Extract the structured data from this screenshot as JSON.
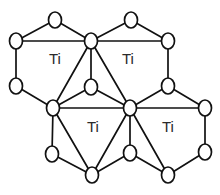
{
  "figure": {
    "background_color": "#ffffff",
    "line_color": "#111111",
    "node_fill_color": "#ffffff",
    "label_color": "#2b2b2b",
    "width": 220,
    "height": 195
  },
  "labels": [
    {
      "text": "Ti",
      "x": 55,
      "y": 60
    },
    {
      "text": "Ti",
      "x": 128,
      "y": 60
    },
    {
      "text": "Ti",
      "x": 93,
      "y": 128
    },
    {
      "text": "Ti",
      "x": 168,
      "y": 128
    }
  ],
  "nodes": [
    {
      "id": "n1",
      "name": "atom-top-left-apex",
      "x": 55,
      "y": 20,
      "rx": 6.5,
      "ry": 8
    },
    {
      "id": "n2",
      "name": "atom-top-right-apex",
      "x": 131,
      "y": 20,
      "rx": 6.5,
      "ry": 8
    },
    {
      "id": "n3",
      "name": "atom-upper-left-corner",
      "x": 16,
      "y": 41,
      "rx": 6.5,
      "ry": 8
    },
    {
      "id": "n4",
      "name": "atom-upper-center-hub",
      "x": 91,
      "y": 41,
      "rx": 6.5,
      "ry": 8
    },
    {
      "id": "n5",
      "name": "atom-upper-right-corner",
      "x": 168,
      "y": 41,
      "rx": 6.5,
      "ry": 8
    },
    {
      "id": "n6",
      "name": "atom-mid-left-edge",
      "x": 16,
      "y": 86,
      "rx": 6.5,
      "ry": 8
    },
    {
      "id": "n7",
      "name": "atom-mid-center-bridge",
      "x": 91,
      "y": 87,
      "rx": 6.5,
      "ry": 8
    },
    {
      "id": "n8",
      "name": "atom-mid-right-edge",
      "x": 168,
      "y": 86,
      "rx": 6.5,
      "ry": 8
    },
    {
      "id": "n9",
      "name": "atom-center-left-hub",
      "x": 53,
      "y": 108,
      "rx": 6.5,
      "ry": 8
    },
    {
      "id": "n10",
      "name": "atom-center-right-hub",
      "x": 130,
      "y": 108,
      "rx": 6.5,
      "ry": 8
    },
    {
      "id": "n11",
      "name": "atom-right-corner-upper",
      "x": 205,
      "y": 108,
      "rx": 6.5,
      "ry": 8
    },
    {
      "id": "n12",
      "name": "atom-lower-left-edge",
      "x": 52,
      "y": 154,
      "rx": 6.5,
      "ry": 8
    },
    {
      "id": "n13",
      "name": "atom-lower-center-edge",
      "x": 130,
      "y": 153,
      "rx": 6.5,
      "ry": 8
    },
    {
      "id": "n14",
      "name": "atom-lower-right-edge",
      "x": 205,
      "y": 152,
      "rx": 6.5,
      "ry": 8
    },
    {
      "id": "n15",
      "name": "atom-bottom-left-apex",
      "x": 92,
      "y": 175,
      "rx": 6.5,
      "ry": 8
    },
    {
      "id": "n16",
      "name": "atom-bottom-right-apex",
      "x": 168,
      "y": 175,
      "rx": 6.5,
      "ry": 8
    }
  ],
  "edges": [
    {
      "from": "n1",
      "to": "n3"
    },
    {
      "from": "n1",
      "to": "n4"
    },
    {
      "from": "n2",
      "to": "n4"
    },
    {
      "from": "n2",
      "to": "n5"
    },
    {
      "from": "n3",
      "to": "n4"
    },
    {
      "from": "n4",
      "to": "n5"
    },
    {
      "from": "n3",
      "to": "n6"
    },
    {
      "from": "n5",
      "to": "n8"
    },
    {
      "from": "n4",
      "to": "n7"
    },
    {
      "from": "n4",
      "to": "n9"
    },
    {
      "from": "n4",
      "to": "n10"
    },
    {
      "from": "n6",
      "to": "n9"
    },
    {
      "from": "n7",
      "to": "n9"
    },
    {
      "from": "n7",
      "to": "n10"
    },
    {
      "from": "n8",
      "to": "n10"
    },
    {
      "from": "n8",
      "to": "n11"
    },
    {
      "from": "n9",
      "to": "n10"
    },
    {
      "from": "n10",
      "to": "n11"
    },
    {
      "from": "n9",
      "to": "n12"
    },
    {
      "from": "n9",
      "to": "n15"
    },
    {
      "from": "n10",
      "to": "n13"
    },
    {
      "from": "n10",
      "to": "n15"
    },
    {
      "from": "n10",
      "to": "n16"
    },
    {
      "from": "n11",
      "to": "n14"
    },
    {
      "from": "n12",
      "to": "n15"
    },
    {
      "from": "n13",
      "to": "n15"
    },
    {
      "from": "n13",
      "to": "n16"
    },
    {
      "from": "n14",
      "to": "n16"
    }
  ]
}
